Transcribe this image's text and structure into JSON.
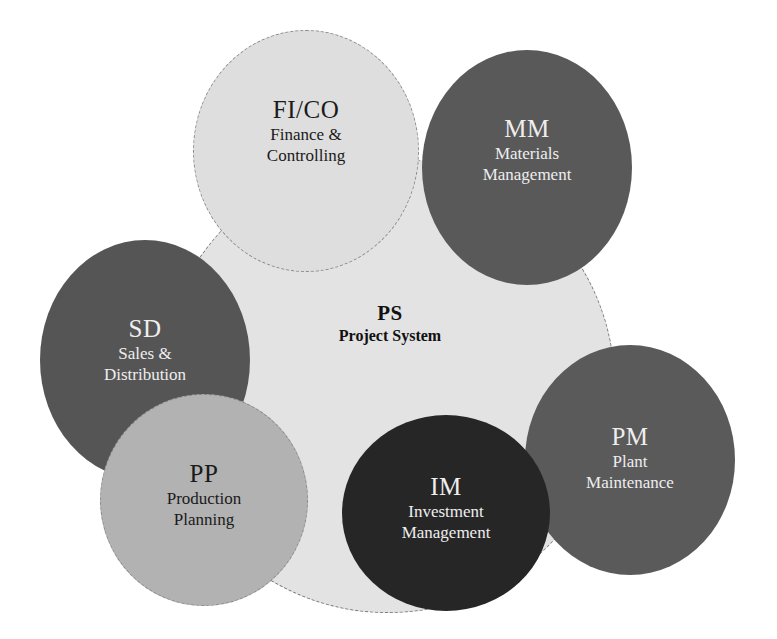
{
  "colors": {
    "background": "#ffffff",
    "core_fill": "#e3e3e3",
    "fico_fill": "#dedede",
    "mm_fill": "#595959",
    "sd_fill": "#555555",
    "pm_fill": "#5a5a5a",
    "im_fill": "#262626",
    "pp_fill": "#b2b2b2",
    "light_text": "#eeeeee",
    "dark_text": "#1a1a1a"
  },
  "center": {
    "abbr": "PS",
    "name": "Project System"
  },
  "modules": [
    {
      "id": "fico",
      "abbr": "FI/CO",
      "line1": "Finance &",
      "line2": "Controlling"
    },
    {
      "id": "mm",
      "abbr": "MM",
      "line1": "Materials",
      "line2": "Management"
    },
    {
      "id": "sd",
      "abbr": "SD",
      "line1": "Sales &",
      "line2": "Distribution"
    },
    {
      "id": "pm",
      "abbr": "PM",
      "line1": "Plant",
      "line2": "Maintenance"
    },
    {
      "id": "im",
      "abbr": "IM",
      "line1": "Investment",
      "line2": "Management"
    },
    {
      "id": "pp",
      "abbr": "PP",
      "line1": "Production",
      "line2": "Planning"
    }
  ]
}
